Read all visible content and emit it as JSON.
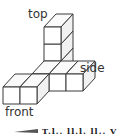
{
  "diagram": {
    "type": "isometric-cube-structure",
    "labels": {
      "top": "top",
      "side": "side",
      "front": "front"
    },
    "cube_size_px": 17,
    "depth_offset": {
      "dx": 12,
      "dy": -13
    },
    "origin": {
      "x": 3,
      "y": 104
    },
    "cubes": [
      {
        "col": 0,
        "row": 0,
        "layer": 0
      },
      {
        "col": 1,
        "row": 0,
        "layer": 0
      },
      {
        "col": 1,
        "row": 1,
        "layer": 0
      },
      {
        "col": 2,
        "row": 1,
        "layer": 0
      },
      {
        "col": 3,
        "row": 1,
        "layer": 0
      },
      {
        "col": 1,
        "row": 2,
        "layer": 0
      },
      {
        "col": 1,
        "row": 2,
        "layer": 1
      },
      {
        "col": 1,
        "row": 2,
        "layer": 2
      }
    ],
    "footer_text": "T.l.. ll.l. ll.. V"
  }
}
